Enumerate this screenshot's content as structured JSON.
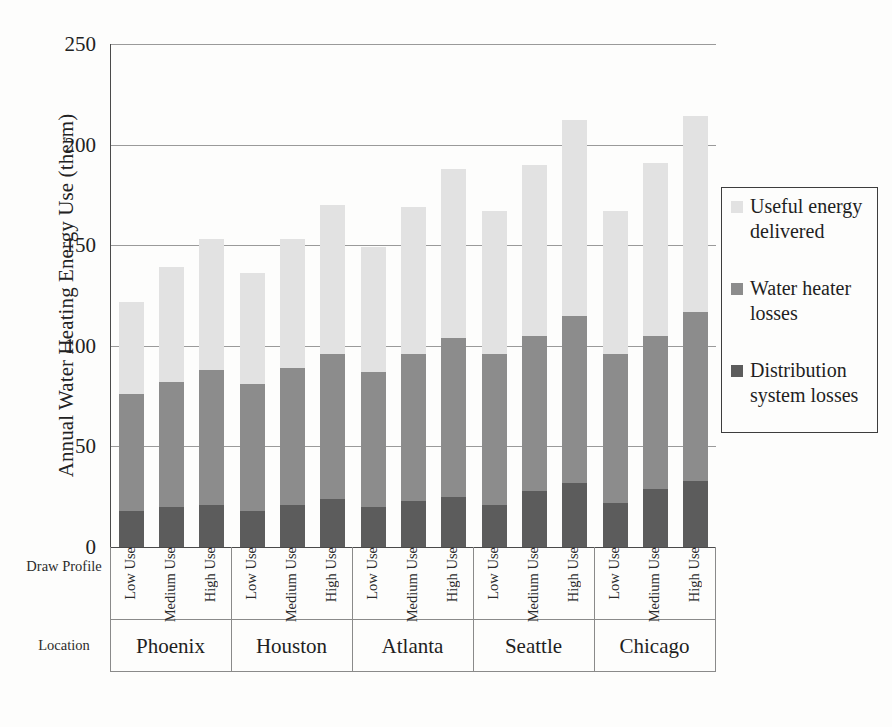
{
  "chart_data": {
    "type": "bar",
    "subtype": "stacked-bar-grouped",
    "title": "",
    "xlabel": "",
    "ylabel": "Annual Water Heating Energy Use (therm)",
    "ylim": [
      0,
      250
    ],
    "yticks": [
      0,
      50,
      100,
      150,
      200,
      250
    ],
    "grid": true,
    "legend_position": "right",
    "row_headers": {
      "draw_profile": "Draw Profile",
      "location": "Location"
    },
    "groups": [
      "Phoenix",
      "Houston",
      "Atlanta",
      "Seattle",
      "Chicago"
    ],
    "categories": [
      "Low Use",
      "Medium Use",
      "High Use",
      "Low Use",
      "Medium Use",
      "High Use",
      "Low Use",
      "Medium Use",
      "High Use",
      "Low Use",
      "Medium Use",
      "High Use",
      "Low Use",
      "Medium Use",
      "High Use"
    ],
    "series": [
      {
        "name": "Distribution system losses",
        "color": "#5c5c5c",
        "values": [
          18,
          20,
          21,
          18,
          21,
          24,
          20,
          23,
          25,
          21,
          28,
          32,
          22,
          29,
          33
        ]
      },
      {
        "name": "Water heater losses",
        "color": "#8c8c8c",
        "values": [
          58,
          62,
          67,
          63,
          68,
          72,
          67,
          73,
          79,
          75,
          77,
          83,
          74,
          76,
          84
        ]
      },
      {
        "name": "Useful energy delivered",
        "color": "#e2e2e2",
        "values": [
          46,
          57,
          65,
          55,
          64,
          74,
          62,
          73,
          84,
          71,
          85,
          97,
          71,
          86,
          97
        ]
      }
    ],
    "stack_totals": [
      122,
      139,
      153,
      136,
      153,
      170,
      149,
      169,
      188,
      167,
      190,
      212,
      167,
      191,
      214
    ],
    "segment_tops": {
      "distribution_system_losses": [
        18,
        20,
        21,
        18,
        21,
        24,
        20,
        23,
        25,
        21,
        28,
        32,
        22,
        29,
        33
      ],
      "water_heater_losses": [
        76,
        82,
        88,
        81,
        89,
        96,
        87,
        96,
        104,
        96,
        105,
        115,
        96,
        105,
        117
      ]
    }
  },
  "legend": {
    "entries": [
      {
        "label": "Useful energy delivered",
        "color": "#e2e2e2"
      },
      {
        "label": "Water heater losses",
        "color": "#8c8c8c"
      },
      {
        "label": "Distribution system losses",
        "color": "#5c5c5c"
      }
    ]
  },
  "colors": {
    "useful_energy": "#e2e2e2",
    "water_heater_losses": "#8c8c8c",
    "distribution_losses": "#5c5c5c",
    "axis": "#4a4a4a",
    "gridline": "#9a9a9a",
    "background": "#fdfdfc"
  }
}
